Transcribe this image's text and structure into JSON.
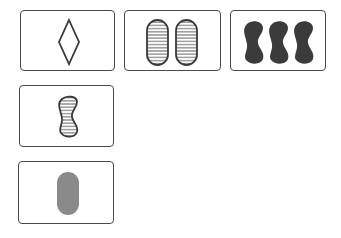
{
  "game": "set-cards",
  "colors": {
    "outline": "#3a3a3a",
    "dark_fill": "#3b3b3b",
    "gray_fill": "#8a8a8a",
    "card_border": "#4a4a4a",
    "background": "#ffffff"
  },
  "cards": [
    {
      "id": "card-1",
      "count": 1,
      "shape": "diamond",
      "shading": "open",
      "color": "#3a3a3a"
    },
    {
      "id": "card-2",
      "count": 2,
      "shape": "oval",
      "shading": "striped",
      "color": "#3a3a3a"
    },
    {
      "id": "card-3",
      "count": 3,
      "shape": "squiggle",
      "shading": "solid",
      "color": "#3b3b3b"
    },
    {
      "id": "card-4",
      "count": 1,
      "shape": "squiggle",
      "shading": "striped",
      "color": "#3a3a3a"
    },
    {
      "id": "card-5",
      "count": 1,
      "shape": "oval",
      "shading": "solid",
      "color": "#8a8a8a"
    }
  ]
}
